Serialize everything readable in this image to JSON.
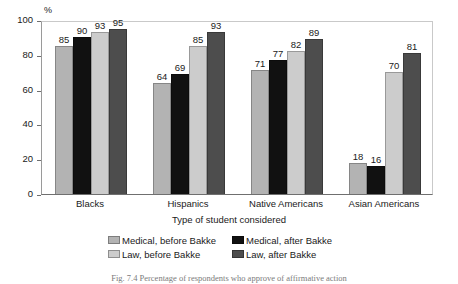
{
  "chart_data": {
    "type": "bar",
    "title": "",
    "ylabel": "%",
    "xlabel": "Type of student considered",
    "categories": [
      "Blacks",
      "Hispanics",
      "Native Americans",
      "Asian Americans"
    ],
    "series": [
      {
        "name": "Medical, before Bakke",
        "color": "#b3b3b3",
        "values": [
          85,
          64,
          71,
          18
        ]
      },
      {
        "name": "Medical, after Bakke",
        "color": "#111111",
        "values": [
          90,
          69,
          77,
          16
        ]
      },
      {
        "name": "Law, before Bakke",
        "color": "#cccccc",
        "values": [
          93,
          85,
          82,
          70
        ]
      },
      {
        "name": "Law, after Bakke",
        "color": "#4d4d4d",
        "values": [
          95,
          93,
          89,
          81
        ]
      }
    ],
    "ylim": [
      0,
      100
    ],
    "yticks": [
      0,
      20,
      40,
      60,
      80,
      100
    ],
    "ytick_labels": [
      "0",
      "20",
      "40",
      "60",
      "80",
      "100"
    ],
    "grid": false,
    "legend_position": "bottom",
    "data_labels": true
  },
  "caption": "Fig. 7.4   Percentage of respondents who approve of affirmative action",
  "axis": {
    "y_unit": "%",
    "x_title": "Type of student considered"
  }
}
